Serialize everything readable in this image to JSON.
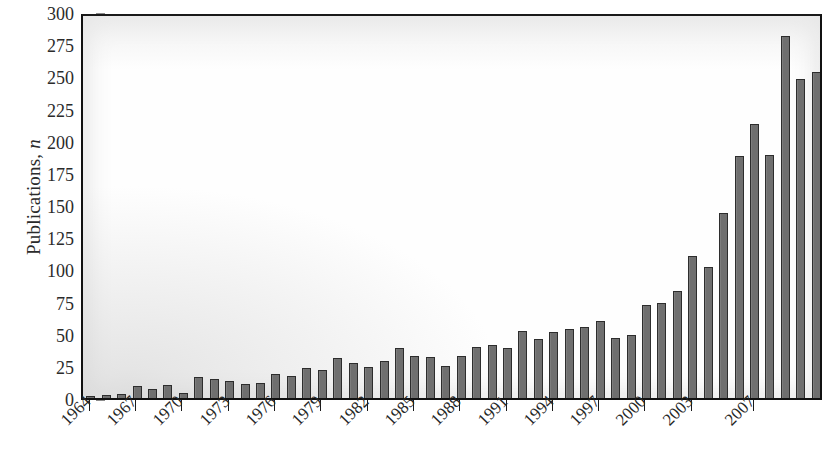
{
  "chart_data": {
    "type": "bar",
    "title": "",
    "xlabel": "",
    "ylabel": "Publications, n",
    "ylabel_plain": "Publications,",
    "ylabel_italic": "n",
    "ylim": [
      0,
      300
    ],
    "ytick_values": [
      0,
      25,
      50,
      75,
      100,
      125,
      150,
      175,
      200,
      225,
      250,
      275,
      300
    ],
    "ytick_labels": [
      "0",
      "25",
      "50",
      "75",
      "100",
      "125",
      "150",
      "175",
      "200",
      "225",
      "250",
      "275",
      "300"
    ],
    "grid": false,
    "legend": null,
    "bar_color": "#6f6f6f",
    "bar_edge_color": "#2d2d2d",
    "axis_color": "#111111",
    "xtick_labels": [
      "1964",
      "1967",
      "1970",
      "1973",
      "1976",
      "1979",
      "1982",
      "1985",
      "1988",
      "1991",
      "1994",
      "1997",
      "2000",
      "2003",
      "2007"
    ],
    "xtick_years": [
      1964,
      1967,
      1970,
      1973,
      1976,
      1979,
      1982,
      1985,
      1988,
      1991,
      1994,
      1997,
      2000,
      2003,
      2007
    ],
    "categories": [
      "1964",
      "1965",
      "1966",
      "1967",
      "1968",
      "1969",
      "1970",
      "1971",
      "1972",
      "1973",
      "1974",
      "1975",
      "1976",
      "1977",
      "1978",
      "1979",
      "1980",
      "1981",
      "1982",
      "1983",
      "1984",
      "1985",
      "1986",
      "1987",
      "1988",
      "1989",
      "1990",
      "1991",
      "1992",
      "1993",
      "1994",
      "1995",
      "1996",
      "1997",
      "1998",
      "1999",
      "2000",
      "2001",
      "2002",
      "2003",
      "2004",
      "2005",
      "2006",
      "2007",
      "2008"
    ],
    "values": [
      1,
      2,
      3,
      9,
      7,
      10,
      4,
      16,
      15,
      13,
      11,
      12,
      19,
      17,
      23,
      22,
      31,
      27,
      24,
      29,
      39,
      33,
      32,
      25,
      33,
      40,
      41,
      39,
      52,
      46,
      51,
      54,
      55,
      60,
      47,
      49,
      72,
      74,
      83,
      110,
      102,
      144,
      188,
      213,
      189
    ],
    "tail_values": [
      281,
      248,
      253
    ],
    "all_values": [
      1,
      2,
      3,
      9,
      7,
      10,
      4,
      16,
      15,
      13,
      11,
      12,
      19,
      17,
      23,
      22,
      31,
      27,
      24,
      29,
      39,
      33,
      32,
      25,
      33,
      40,
      41,
      39,
      52,
      46,
      51,
      54,
      55,
      60,
      47,
      49,
      72,
      74,
      83,
      110,
      102,
      144,
      188,
      213,
      189,
      281,
      248,
      253
    ]
  }
}
